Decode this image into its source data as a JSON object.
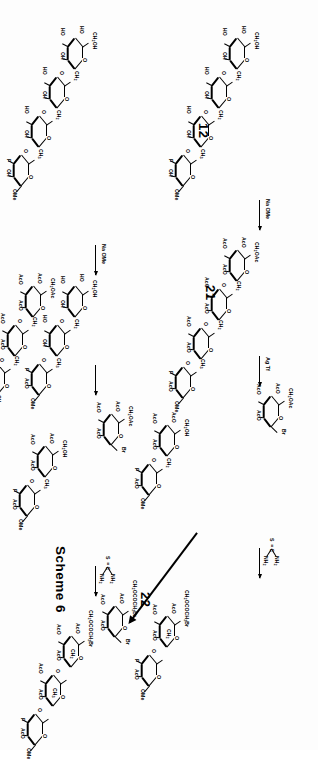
{
  "figure": {
    "caption": "Scheme 6",
    "type": "chemical-reaction-scheme",
    "orientation": "rotated-90-landscape-on-portrait-page"
  },
  "compound_numbers": [
    {
      "id": "12",
      "label": "12"
    },
    {
      "id": "21",
      "label": "21"
    },
    {
      "id": "22",
      "label": "22"
    }
  ],
  "reagents": [
    {
      "id": "agtf",
      "label": "Ag Tf"
    },
    {
      "id": "naome-1",
      "label": "Na OMe"
    },
    {
      "id": "naome-2",
      "label": "Na OMe"
    },
    {
      "id": "thiourea-1",
      "label": "thiourea"
    },
    {
      "id": "thiourea-2",
      "label": "thiourea"
    }
  ],
  "thiourea": {
    "sulfur": "S",
    "carbon": "C",
    "amine_top": "NH",
    "amine_top_sub": "2",
    "amine_bottom": "NH",
    "amine_bottom_sub": "2",
    "double_bond": "="
  },
  "group_labels": {
    "AcO": "AcO",
    "HO": "HO",
    "OH": "OH",
    "OMe": "OMe",
    "Br": "Br",
    "F": "F",
    "O": "O",
    "CH2OAc": "CH",
    "CH2OAc_sub": "2",
    "CH2OAc_tail": "OAc",
    "CH2OH": "CH",
    "CH2OH_sub": "2",
    "CH2OH_tail": "OH",
    "CH2": "CH",
    "CH2_sub": "2",
    "CH3": "CH",
    "CH3_sub": "3",
    "CH2OCOCH2Br": "CH",
    "CH2OCOCH2Br_sub1": "2",
    "CH2OCOCH2Br_mid": "OCOCH",
    "CH2OCOCH2Br_sub2": "2",
    "CH2OCOCH2Br_tail": "Br"
  },
  "structures": [
    {
      "id": "s-12",
      "name": "tetrasaccharide-12-free-hydroxyl",
      "compound": "12",
      "rings": 4,
      "labels": [
        "HO",
        "CH2OH",
        "HO",
        "OH",
        "O",
        "HO",
        "CH2",
        "O",
        "OH",
        "O",
        "HO",
        "CH2",
        "O",
        "F",
        "OH",
        "OMe"
      ]
    },
    {
      "id": "s-peracetyl-tetra",
      "name": "peracetylated-tetrasaccharide-fluoride",
      "rings": 4,
      "labels": [
        "AcO",
        "CH2OAc",
        "AcO",
        "AcO",
        "O",
        "AcO",
        "CH2",
        "O",
        "AcO",
        "O",
        "AcO",
        "CH3",
        "F",
        "AcO",
        "OMe"
      ]
    },
    {
      "id": "s-bromide-donor-left",
      "name": "acetobromo-sugar-donor",
      "rings": 1,
      "labels": [
        "AcO",
        "CH2OAc",
        "AcO",
        "O",
        "AcO",
        "Br"
      ]
    },
    {
      "id": "s-acceptor-left",
      "name": "disaccharide-acceptor-free-OH",
      "rings": 2,
      "labels": [
        "AcO",
        "CH2OH",
        "AcO",
        "AcO",
        "O",
        "AcO",
        "CH2",
        "F",
        "OMe",
        "AcO"
      ]
    },
    {
      "id": "s-bromoacetate-left",
      "name": "bromoacetyl-disaccharide-22-precursor",
      "rings": 2,
      "labels": [
        "AcO",
        "CH2OCOCH2Br",
        "AcO",
        "AcO",
        "O",
        "AcO",
        "CH2",
        "F",
        "OMe",
        "AcO"
      ]
    },
    {
      "id": "s-22",
      "name": "bromoacetyl-glycosyl-bromide-22",
      "compound": "22",
      "rings": 1,
      "labels": [
        "AcO",
        "CH2OCOCH2Br",
        "AcO",
        "O",
        "AcO",
        "Br"
      ]
    },
    {
      "id": "s-21",
      "name": "tetrasaccharide-21-free-hydroxyl",
      "compound": "21",
      "rings": 4,
      "labels": [
        "HO",
        "CH2OH",
        "HO",
        "OH",
        "O",
        "HO",
        "CH2",
        "O",
        "OH",
        "O",
        "HO",
        "CH3",
        "O",
        "F",
        "OH",
        "OMe"
      ]
    },
    {
      "id": "s-peracetyl-tetra-r",
      "name": "peracetylated-tetrasaccharide-fluoride-right",
      "rings": 4,
      "labels": [
        "AcO",
        "CH2OAc",
        "AcO",
        "AcO",
        "O",
        "AcO",
        "CH2",
        "O",
        "AcO",
        "O",
        "AcO",
        "CH3",
        "F",
        "AcO",
        "OMe"
      ]
    },
    {
      "id": "s-bromide-donor-right",
      "name": "acetobromo-sugar-donor-right",
      "rings": 1,
      "labels": [
        "AcO",
        "CH2OAc",
        "AcO",
        "O",
        "AcO",
        "Br"
      ]
    },
    {
      "id": "s-acceptor-right",
      "name": "disaccharide-acceptor-free-OH-right",
      "rings": 2,
      "labels": [
        "AcO",
        "CH2OH",
        "AcO",
        "AcO",
        "O",
        "AcO",
        "CH3",
        "F",
        "AcO",
        "OMe"
      ]
    },
    {
      "id": "s-bromoacetate-right",
      "name": "bromoacetyl-trisaccharide-right",
      "rings": 3,
      "labels": [
        "AcO",
        "CH2OCOCH2Br",
        "AcO",
        "AcO",
        "O",
        "AcO",
        "CH2",
        "O",
        "AcO",
        "AcO",
        "CH3",
        "F",
        "AcO",
        "OMe"
      ]
    },
    {
      "id": "s-partial-r",
      "name": "partially-deprotected-right-intermediate",
      "rings": 3,
      "labels": [
        "HO",
        "CH2OH",
        "HO",
        "OH",
        "O",
        "HO",
        "CH2",
        "O",
        "OH",
        "AcO",
        "OMe"
      ]
    }
  ]
}
